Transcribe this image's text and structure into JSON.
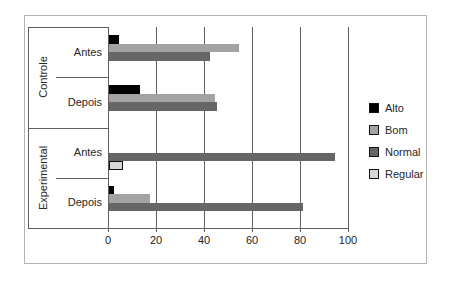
{
  "chart_data": {
    "type": "bar",
    "orientation": "horizontal",
    "title": "",
    "xlabel": "",
    "ylabel": "",
    "xlim": [
      0,
      100
    ],
    "xticks": [
      0,
      20,
      40,
      60,
      80,
      100
    ],
    "grid": true,
    "legend_position": "right",
    "groups": [
      "Controle",
      "Experimental"
    ],
    "categories": [
      {
        "group": "Controle",
        "label": "Antes"
      },
      {
        "group": "Controle",
        "label": "Depois"
      },
      {
        "group": "Experimental",
        "label": "Antes"
      },
      {
        "group": "Experimental",
        "label": "Depois"
      }
    ],
    "series": [
      {
        "name": "Alto",
        "color": "#000000",
        "border": false,
        "values": [
          4,
          13,
          0,
          2
        ]
      },
      {
        "name": "Bom",
        "color": "#a3a3a3",
        "border": false,
        "values": [
          54,
          44,
          0,
          17
        ]
      },
      {
        "name": "Normal",
        "color": "#666666",
        "border": false,
        "values": [
          42,
          45,
          94,
          81
        ]
      },
      {
        "name": "Regular",
        "color": "#d8d8d8",
        "border": true,
        "values": [
          0,
          0,
          6,
          0
        ]
      }
    ],
    "colors": {
      "grid_line": "#5f5f5f",
      "frame_border": "#b3b3b3",
      "text": "#262626",
      "background": "#ffffff"
    }
  }
}
